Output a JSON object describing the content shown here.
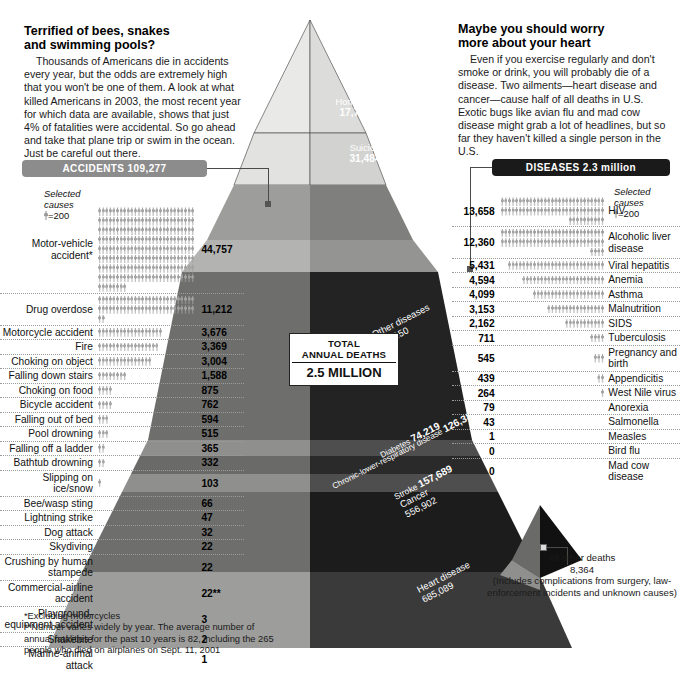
{
  "intro_left": {
    "heading_line1": "Terrified of bees, snakes",
    "heading_line2": "and swimming pools?",
    "body": "Thousands of Americans die in accidents every year, but the odds are extremely high that you won't be one of them. A look at what killed Americans in 2003,  the most recent year for which data are available, shows that just 4% of fatalities were accidental. So go ahead and take that plane trip or swim in the ocean. Just be careful out there."
  },
  "intro_right": {
    "heading_line1": "Maybe you should worry",
    "heading_line2": "more about your heart",
    "body": "Even if you exercise regularly and don't smoke or drink, you will probably die of a disease. Two ailments—heart disease and cancer—cause half of all deaths in U.S. Exotic bugs like avian flu and mad cow disease might grab a lot of headlines, but so far they haven't killed a single person in the U.S."
  },
  "banners": {
    "accidents": "ACCIDENTS 109,277",
    "diseases": "DISEASES 2.3 million",
    "accidents_color": "#8c8c8c",
    "diseases_color": "#1a1a1a"
  },
  "legend": {
    "line1": "Selected",
    "line2": "causes",
    "unit": "=200",
    "unit_value": 200
  },
  "total_box": {
    "line1": "TOTAL",
    "line2": "ANNUAL DEATHS",
    "line3": "2.5 MILLION"
  },
  "all_other": {
    "title": "All other deaths",
    "value": "8,364",
    "note": "(Includes complications from surgery, law-enforcement incidents and unknown causes)"
  },
  "footnote": {
    "line1": "*Excluding motorcycles",
    "line2": "**Number varies widely by year. The average number of annual fatalities for the past 10 years is 82,  including the 265 people who died on airplanes on Sept. 11, 2001"
  },
  "pyramid_labels": [
    {
      "name": "Homicide",
      "value": "17,732"
    },
    {
      "name": "Suicide",
      "value": "31,484"
    },
    {
      "name": "Other diseases",
      "value": "681,150"
    },
    {
      "name": "Diabetes",
      "value": "74,219"
    },
    {
      "name": "Chronic-lower-respiratory disease",
      "value": "126,382"
    },
    {
      "name": "Stroke",
      "value": "157,689"
    },
    {
      "name": "Cancer",
      "value": "556,902"
    },
    {
      "name": "Heart disease",
      "value": "685,089"
    }
  ],
  "chart_data": {
    "type": "bar",
    "subtitle": "TOTAL ANNUAL DEATHS 2.5 MILLION",
    "unit_per_figure": 200,
    "xlabel": "",
    "ylabel": "Deaths",
    "grid": false,
    "legend_position": "top-inline",
    "series": [
      {
        "name": "ACCIDENTS 109,277",
        "total": 109277,
        "categories": [
          "Motor-vehicle accident*",
          "Drug overdose",
          "Motorcycle accident",
          "Fire",
          "Choking on object",
          "Falling down stairs",
          "Choking on food",
          "Bicycle accident",
          "Falling out of bed",
          "Pool drowning",
          "Falling off a ladder",
          "Bathtub drowning",
          "Slipping on ice/snow",
          "Bee/wasp sting",
          "Lightning strike",
          "Dog attack",
          "Skydiving",
          "Crushing by human stampede",
          "Commercial-airline accident",
          "Playground-equipment accident",
          "Snakebite",
          "Marine-animal attack"
        ],
        "values": [
          44757,
          11212,
          3676,
          3369,
          3004,
          1588,
          875,
          762,
          594,
          515,
          365,
          332,
          103,
          66,
          47,
          32,
          22,
          22,
          22,
          3,
          2,
          1
        ],
        "labels": [
          "44,757",
          "11,212",
          "3,676",
          "3,369",
          "3,004",
          "1,588",
          "875",
          "762",
          "594",
          "515",
          "365",
          "332",
          "103",
          "66",
          "47",
          "32",
          "22",
          "22",
          "22**",
          "3",
          "2",
          "1"
        ]
      },
      {
        "name": "DISEASES 2.3 million",
        "total": 2300000,
        "categories": [
          "HIV",
          "Alcoholic liver disease",
          "Viral hepatitis",
          "Anemia",
          "Asthma",
          "Malnutrition",
          "SIDS",
          "Tuberculosis",
          "Pregnancy and birth",
          "Appendicitis",
          "West Nile virus",
          "Anorexia",
          "Salmonella",
          "Measles",
          "Bird flu",
          "Mad cow disease"
        ],
        "values": [
          13658,
          12360,
          5431,
          4594,
          4099,
          3153,
          2162,
          711,
          545,
          439,
          264,
          79,
          43,
          1,
          0,
          0
        ],
        "labels": [
          "13,658",
          "12,360",
          "5,431",
          "4,594",
          "4,099",
          "3,153",
          "2,162",
          "711",
          "545",
          "439",
          "264",
          "79",
          "43",
          "1",
          "0",
          "0"
        ]
      },
      {
        "name": "Pyramid bands",
        "categories": [
          "Homicide",
          "Suicide",
          "Other diseases",
          "Diabetes",
          "Chronic-lower-respiratory disease",
          "Stroke",
          "Cancer",
          "Heart disease",
          "All other deaths"
        ],
        "values": [
          17732,
          31484,
          681150,
          74219,
          126382,
          157689,
          556902,
          685089,
          8364
        ],
        "labels": [
          "17,732",
          "31,484",
          "681,150",
          "74,219",
          "126,382",
          "157,689",
          "556,902",
          "685,089",
          "8,364"
        ]
      }
    ]
  }
}
